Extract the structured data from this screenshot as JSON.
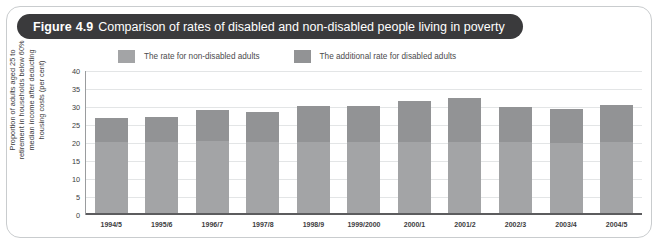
{
  "figure": {
    "label": "Figure",
    "number": "4.9",
    "title": "Comparison of rates of disabled and non-disabled people living in poverty"
  },
  "colors": {
    "title_pill_bg": "#3a3a3c",
    "title_text": "#ffffff",
    "frame_border": "#c9ccce",
    "series_non_disabled": "#a3a4a6",
    "series_additional_disabled": "#929395",
    "gridline": "#e3e5e6",
    "axis_line": "#5c5c5e",
    "text": "#3c3c3e"
  },
  "legend": {
    "position": "top",
    "items": [
      {
        "label": "The rate for non-disabled adults",
        "color": "#a3a4a6"
      },
      {
        "label": "The additional rate for disabled adults",
        "color": "#929395"
      }
    ]
  },
  "chart_data": {
    "type": "bar",
    "subtype": "stacked",
    "title": "Comparison of rates of disabled and non-disabled people living in poverty",
    "xlabel": "",
    "ylabel": "Proportion of adults aged 25 to retirement in households below 60% median income after deducting housing costs (per cent)",
    "ylabel_lines": [
      "Proportion of adults aged 25 to",
      "retirement in households below 60%",
      "median income after deducting",
      "housing costs (per cent)"
    ],
    "ylim": [
      0,
      40
    ],
    "yticks": [
      0,
      5,
      10,
      15,
      20,
      25,
      30,
      35,
      40
    ],
    "ytick_labels": [
      "0",
      "5",
      "10",
      "15",
      "20",
      "25",
      "30",
      "35",
      "40"
    ],
    "grid": true,
    "legend_position": "top",
    "categories": [
      "1994/5",
      "1995/6",
      "1996/7",
      "1997/8",
      "1998/9",
      "1999/2000",
      "2000/1",
      "2001/2",
      "2002/3",
      "2003/4",
      "2004/5"
    ],
    "series": [
      {
        "name": "The rate for non-disabled adults",
        "color": "#a3a4a6",
        "values": [
          20.4,
          20.4,
          20.5,
          20.3,
          20.4,
          20.4,
          20.3,
          20.3,
          20.2,
          20.1,
          20.2
        ]
      },
      {
        "name": "The additional rate for disabled adults",
        "color": "#929395",
        "values": [
          6.5,
          6.7,
          8.8,
          8.4,
          9.9,
          10.0,
          11.5,
          12.2,
          9.9,
          9.3,
          10.3
        ]
      }
    ],
    "totals": [
      26.9,
      27.1,
      29.3,
      28.7,
      30.3,
      30.4,
      31.8,
      32.5,
      30.1,
      29.4,
      30.5
    ]
  }
}
